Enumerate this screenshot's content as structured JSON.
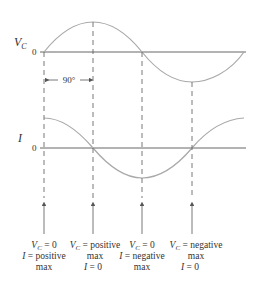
{
  "diagram": {
    "colors": {
      "curve": "#a9a9a9",
      "axis": "#666666",
      "text": "#333333"
    },
    "vc_graph": {
      "label": "V",
      "label_sub": "C",
      "zero_label": "0"
    },
    "i_graph": {
      "label": "I",
      "zero_label": "0"
    },
    "phase_annotation": "90°",
    "markers": [
      {
        "line1": "V_C = 0",
        "line1_v": "V",
        "line1_sub": "C",
        "line1_rest": " = 0",
        "line2": "I = positive",
        "line2_i": "I",
        "line2_rest": " = positive",
        "line3": "max"
      },
      {
        "line1": "V_C = positive",
        "line1_v": "V",
        "line1_sub": "C",
        "line1_rest": " = positive",
        "line2": "max",
        "line3": "I = 0",
        "line3_i": "I",
        "line3_rest": " = 0"
      },
      {
        "line1": "V_C = 0",
        "line1_v": "V",
        "line1_sub": "C",
        "line1_rest": " = 0",
        "line2": "I = negative",
        "line2_i": "I",
        "line2_rest": " = negative",
        "line3": "max"
      },
      {
        "line1": "V_C = negative",
        "line1_v": "V",
        "line1_sub": "C",
        "line1_rest": " = negative",
        "line2": "max",
        "line3": "I = 0",
        "line3_i": "I",
        "line3_rest": " = 0"
      }
    ]
  }
}
